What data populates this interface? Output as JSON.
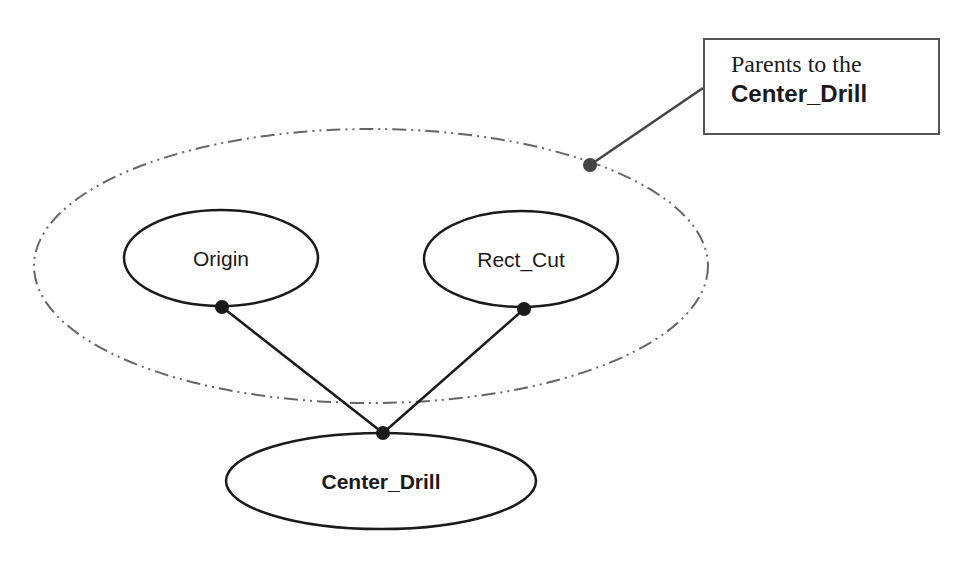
{
  "diagram": {
    "type": "dependency-graph",
    "nodes": [
      {
        "id": "origin",
        "label": "Origin",
        "bold": false
      },
      {
        "id": "rect_cut",
        "label": "Rect_Cut",
        "bold": false
      },
      {
        "id": "center_drill",
        "label": "Center_Drill",
        "bold": true
      }
    ],
    "edges": [
      {
        "from": "origin",
        "to": "center_drill"
      },
      {
        "from": "rect_cut",
        "to": "center_drill"
      }
    ],
    "group": {
      "members": [
        "origin",
        "rect_cut"
      ],
      "style": "dash-dot ellipse"
    },
    "callout": {
      "line1": "Parents to the",
      "line2": "Center_Drill"
    },
    "colors": {
      "line": "#1a1a1a",
      "group_outline": "#666666",
      "callout_border": "#555555",
      "background": "#ffffff"
    }
  }
}
